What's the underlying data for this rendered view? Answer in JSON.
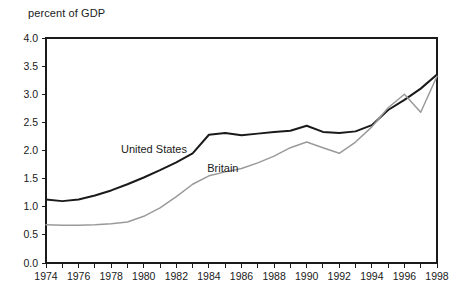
{
  "chart_data": {
    "type": "line",
    "title": "percent of GDP",
    "xlabel": "",
    "ylabel": "",
    "xlim": [
      1974,
      1998
    ],
    "ylim": [
      0.0,
      4.0
    ],
    "ytick_values": [
      0.0,
      0.5,
      1.0,
      1.5,
      2.0,
      2.5,
      3.0,
      3.5,
      4.0
    ],
    "ytick_labels": [
      "0.0",
      "0.5",
      "1.0",
      "1.5",
      "2.0",
      "2.5",
      "3.0",
      "3.5",
      "4.0"
    ],
    "xtick_values": [
      1974,
      1975,
      1976,
      1977,
      1978,
      1979,
      1980,
      1981,
      1982,
      1983,
      1984,
      1985,
      1986,
      1987,
      1988,
      1989,
      1990,
      1991,
      1992,
      1993,
      1994,
      1995,
      1996,
      1997,
      1998
    ],
    "xtick_labels": [
      "1974",
      "",
      "1976",
      "",
      "1978",
      "",
      "1980",
      "",
      "1982",
      "",
      "1984",
      "",
      "1986",
      "",
      "1988",
      "",
      "1990",
      "",
      "1992",
      "",
      "1994",
      "",
      "1996",
      "",
      "1998"
    ],
    "grid": false,
    "legend_position": "inline-annotation",
    "x": [
      1974,
      1975,
      1976,
      1977,
      1978,
      1979,
      1980,
      1981,
      1982,
      1983,
      1984,
      1985,
      1986,
      1987,
      1988,
      1989,
      1990,
      1991,
      1992,
      1993,
      1994,
      1995,
      1996,
      1997,
      1998
    ],
    "series": [
      {
        "name": "United States",
        "color": "#1a1a1a",
        "width": 2.0,
        "label_x": 1978.6,
        "label_y": 1.95,
        "values": [
          1.13,
          1.1,
          1.13,
          1.2,
          1.29,
          1.4,
          1.52,
          1.65,
          1.79,
          1.95,
          2.28,
          2.31,
          2.27,
          2.3,
          2.33,
          2.35,
          2.44,
          2.33,
          2.31,
          2.34,
          2.45,
          2.72,
          2.9,
          3.1,
          3.35
        ]
      },
      {
        "name": "Britain",
        "color": "#9a9a9a",
        "width": 1.5,
        "label_x": 1983.9,
        "label_y": 1.62,
        "values": [
          0.68,
          0.67,
          0.67,
          0.68,
          0.7,
          0.73,
          0.83,
          0.98,
          1.18,
          1.4,
          1.55,
          1.62,
          1.68,
          1.78,
          1.9,
          2.05,
          2.15,
          2.05,
          1.95,
          2.15,
          2.42,
          2.76,
          3.0,
          2.68,
          3.32
        ]
      }
    ]
  }
}
